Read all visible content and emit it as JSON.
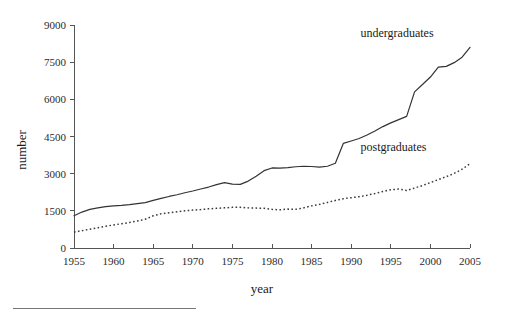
{
  "chart_data": {
    "type": "line",
    "title": "",
    "subtitle": "",
    "xlabel": "year",
    "ylabel": "number",
    "xlim": [
      1955,
      2005
    ],
    "ylim": [
      0,
      9000
    ],
    "grid": false,
    "legend_position": "inline-right",
    "x_ticks": [
      "1955",
      "1960",
      "1965",
      "1970",
      "1975",
      "1980",
      "1985",
      "1990",
      "1995",
      "2000",
      "2005"
    ],
    "x_tick_values": [
      1955,
      1960,
      1965,
      1970,
      1975,
      1980,
      1985,
      1990,
      1995,
      2000,
      2005
    ],
    "y_ticks": [
      "0",
      "1500",
      "3000",
      "4500",
      "6000",
      "7500",
      "9000"
    ],
    "y_tick_values": [
      0,
      1500,
      3000,
      4500,
      6000,
      7500,
      9000
    ],
    "x": [
      1955,
      1956,
      1957,
      1958,
      1959,
      1960,
      1961,
      1962,
      1963,
      1964,
      1965,
      1966,
      1967,
      1968,
      1969,
      1970,
      1971,
      1972,
      1973,
      1974,
      1975,
      1976,
      1977,
      1978,
      1979,
      1980,
      1981,
      1982,
      1983,
      1984,
      1985,
      1986,
      1987,
      1988,
      1989,
      1990,
      1991,
      1992,
      1993,
      1994,
      1995,
      1996,
      1997,
      1998,
      1999,
      2000,
      2001,
      2002,
      2003,
      2004,
      2005
    ],
    "series": [
      {
        "name": "undergraduates",
        "style": "solid",
        "color": "#333333",
        "values": [
          1300,
          1450,
          1560,
          1620,
          1670,
          1700,
          1720,
          1750,
          1790,
          1830,
          1920,
          2000,
          2080,
          2150,
          2230,
          2300,
          2380,
          2460,
          2560,
          2640,
          2580,
          2570,
          2700,
          2900,
          3120,
          3230,
          3220,
          3240,
          3280,
          3300,
          3290,
          3260,
          3300,
          3420,
          4220,
          4320,
          4420,
          4560,
          4720,
          4900,
          5050,
          5180,
          5310,
          6300,
          6600,
          6900,
          7300,
          7330,
          7480,
          7700,
          8100
        ]
      },
      {
        "name": "postgraduates",
        "style": "dotted",
        "color": "#3a3a3a",
        "values": [
          640,
          700,
          760,
          820,
          880,
          930,
          980,
          1030,
          1090,
          1160,
          1300,
          1380,
          1420,
          1460,
          1500,
          1530,
          1550,
          1580,
          1600,
          1620,
          1640,
          1640,
          1620,
          1610,
          1600,
          1560,
          1540,
          1570,
          1560,
          1620,
          1700,
          1760,
          1840,
          1920,
          1990,
          2030,
          2070,
          2130,
          2200,
          2280,
          2350,
          2380,
          2320,
          2420,
          2520,
          2640,
          2760,
          2880,
          3010,
          3180,
          3400
        ]
      }
    ],
    "annotations": [
      {
        "name": "undergraduates-label",
        "text": "undergraduates",
        "x": 1999,
        "y": 8500
      },
      {
        "name": "postgraduates-label",
        "text": "postgraduates",
        "x": 1999,
        "y": 3900
      }
    ]
  }
}
